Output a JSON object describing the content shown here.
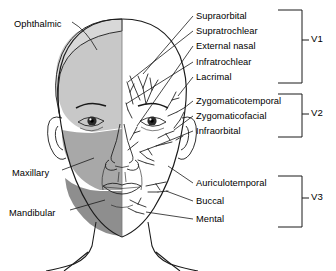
{
  "figure": {
    "colors": {
      "ophthalmic_shade": "#c7c7c7",
      "maxillary_shade": "#a9a9a9",
      "mandibular_shade": "#8d8d8d",
      "skin": "#ffffff",
      "line": "#1a1a1a",
      "hair": "#d5d5d5"
    }
  },
  "left_labels": [
    {
      "id": "ophthalmic",
      "text": "Ophthalmic",
      "x": 14,
      "y": 19
    },
    {
      "id": "maxillary",
      "text": "Maxillary",
      "x": 12,
      "y": 168
    },
    {
      "id": "mandibular",
      "text": "Mandibular",
      "x": 9,
      "y": 208
    }
  ],
  "right_labels": [
    {
      "id": "supraorbital",
      "text": "Supraorbital",
      "x": 196,
      "y": 13,
      "division": "V1"
    },
    {
      "id": "supratrochlear",
      "text": "Supratrochlear",
      "x": 196,
      "y": 28,
      "division": "V1"
    },
    {
      "id": "external-nasal",
      "text": "External nasal",
      "x": 196,
      "y": 43,
      "division": "V1"
    },
    {
      "id": "infratrochlear",
      "text": "Infratrochlear",
      "x": 196,
      "y": 59,
      "division": "V1"
    },
    {
      "id": "lacrimal",
      "text": "Lacrimal",
      "x": 196,
      "y": 74,
      "division": "V1"
    },
    {
      "id": "zygomaticotemporal",
      "text": "Zygomaticotemporal",
      "x": 196,
      "y": 98,
      "division": "V2"
    },
    {
      "id": "zygomaticofacial",
      "text": "Zygomaticofacial",
      "x": 196,
      "y": 113,
      "division": "V2"
    },
    {
      "id": "infraorbital",
      "text": "Infraorbital",
      "x": 196,
      "y": 128,
      "division": "V2"
    },
    {
      "id": "auriculotemporal",
      "text": "Auriculotemporal",
      "x": 196,
      "y": 180,
      "division": "V3"
    },
    {
      "id": "buccal",
      "text": "Buccal",
      "x": 196,
      "y": 198,
      "division": "V3"
    },
    {
      "id": "mental",
      "text": "Mental",
      "x": 196,
      "y": 216,
      "division": "V3"
    }
  ],
  "divisions": [
    {
      "id": "v1",
      "text": "V1",
      "x": 312,
      "y": 38,
      "bracket_top": 10,
      "bracket_bottom": 83
    },
    {
      "id": "v2",
      "text": "V2",
      "x": 312,
      "y": 112,
      "bracket_top": 94,
      "bracket_bottom": 137
    },
    {
      "id": "v3",
      "text": "V3",
      "x": 312,
      "y": 196,
      "bracket_top": 176,
      "bracket_bottom": 227
    }
  ]
}
